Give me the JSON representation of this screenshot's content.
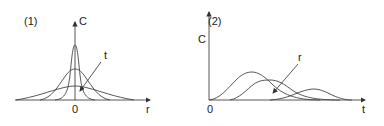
{
  "panel1": {
    "label": "(1)",
    "y_axis": "C",
    "x_axis": "r",
    "origin": "0",
    "arrow_label": "t",
    "description": "Concentration C vs distance r: Gaussian profiles spreading and flattening as time t increases"
  },
  "panel2": {
    "label": "(2)",
    "y_axis": "C",
    "x_axis": "t",
    "origin": "0",
    "arrow_label": "r",
    "description": "Concentration C vs time t at increasing distances r: peaks delayed and lowered"
  },
  "colors": {
    "line": "#444444",
    "text": "#222222"
  }
}
